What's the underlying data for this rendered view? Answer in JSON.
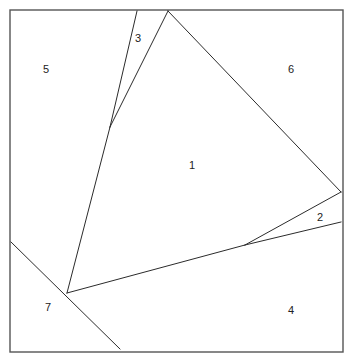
{
  "figure": {
    "type": "planar-subdivision-diagram",
    "width": 353,
    "height": 363,
    "background_color": "#ffffff",
    "stroke_color": "#2b2b2b",
    "frame_stroke_color": "#555555",
    "label_color": "#222222",
    "stroke_width": 1,
    "frame_stroke_width": 1.4
  },
  "frame": {
    "name": "bounding-square",
    "x": 10,
    "y": 10,
    "width": 333,
    "height": 342
  },
  "vertices": [
    {
      "id": "A",
      "name": "apex-top",
      "x": 168,
      "y": 11
    },
    {
      "id": "B",
      "name": "right-edge-vertex",
      "x": 341,
      "y": 192
    },
    {
      "id": "C",
      "name": "mid-right-junction",
      "x": 245,
      "y": 245
    },
    {
      "id": "D",
      "name": "bottom-left-junction",
      "x": 67,
      "y": 293
    },
    {
      "id": "E",
      "name": "sliver-vertex",
      "x": 110,
      "y": 127
    },
    {
      "id": "F",
      "name": "top-edge-left-vertex",
      "x": 137,
      "y": 11
    },
    {
      "id": "G",
      "name": "left-edge-vertex",
      "x": 11,
      "y": 242
    },
    {
      "id": "H",
      "name": "bottom-edge-vertex",
      "x": 120,
      "y": 349
    },
    {
      "id": "I",
      "name": "right-edge-lower-vertex",
      "x": 341,
      "y": 222
    }
  ],
  "segments": [
    {
      "name": "segment-apex-to-right",
      "from": "A",
      "to": "B",
      "x1": 168,
      "y1": 11,
      "x2": 341,
      "y2": 192
    },
    {
      "name": "segment-apex-to-sliver",
      "from": "A",
      "to": "E",
      "x1": 168,
      "y1": 11,
      "x2": 110,
      "y2": 127
    },
    {
      "name": "segment-topleft-to-sliver",
      "from": "F",
      "to": "E",
      "x1": 137,
      "y1": 11,
      "x2": 110,
      "y2": 127
    },
    {
      "name": "segment-sliver-to-bottomleft",
      "from": "E",
      "to": "D",
      "x1": 110,
      "y1": 127,
      "x2": 67,
      "y2": 293
    },
    {
      "name": "segment-bottomleft-to-midright",
      "from": "D",
      "to": "C",
      "x1": 67,
      "y1": 293,
      "x2": 245,
      "y2": 245
    },
    {
      "name": "segment-midright-to-right",
      "from": "C",
      "to": "B",
      "x1": 245,
      "y1": 245,
      "x2": 341,
      "y2": 192
    },
    {
      "name": "segment-midright-to-rightlower",
      "from": "C",
      "to": "I",
      "x1": 245,
      "y1": 245,
      "x2": 341,
      "y2": 222
    },
    {
      "name": "segment-leftedge-to-bottomedge",
      "from": "G",
      "to": "H",
      "x1": 11,
      "y1": 242,
      "x2": 120,
      "y2": 349
    }
  ],
  "region_labels": [
    {
      "id": "r1",
      "name": "region-label-1",
      "text": "1",
      "x": 192,
      "y": 166
    },
    {
      "id": "r2",
      "name": "region-label-2",
      "text": "2",
      "x": 320,
      "y": 218
    },
    {
      "id": "r3",
      "name": "region-label-3",
      "text": "3",
      "x": 138,
      "y": 39
    },
    {
      "id": "r4",
      "name": "region-label-4",
      "text": "4",
      "x": 291,
      "y": 311
    },
    {
      "id": "r5",
      "name": "region-label-5",
      "text": "5",
      "x": 46,
      "y": 70
    },
    {
      "id": "r6",
      "name": "region-label-6",
      "text": "6",
      "x": 291,
      "y": 70
    },
    {
      "id": "r7",
      "name": "region-label-7",
      "text": "7",
      "x": 48,
      "y": 308
    }
  ]
}
